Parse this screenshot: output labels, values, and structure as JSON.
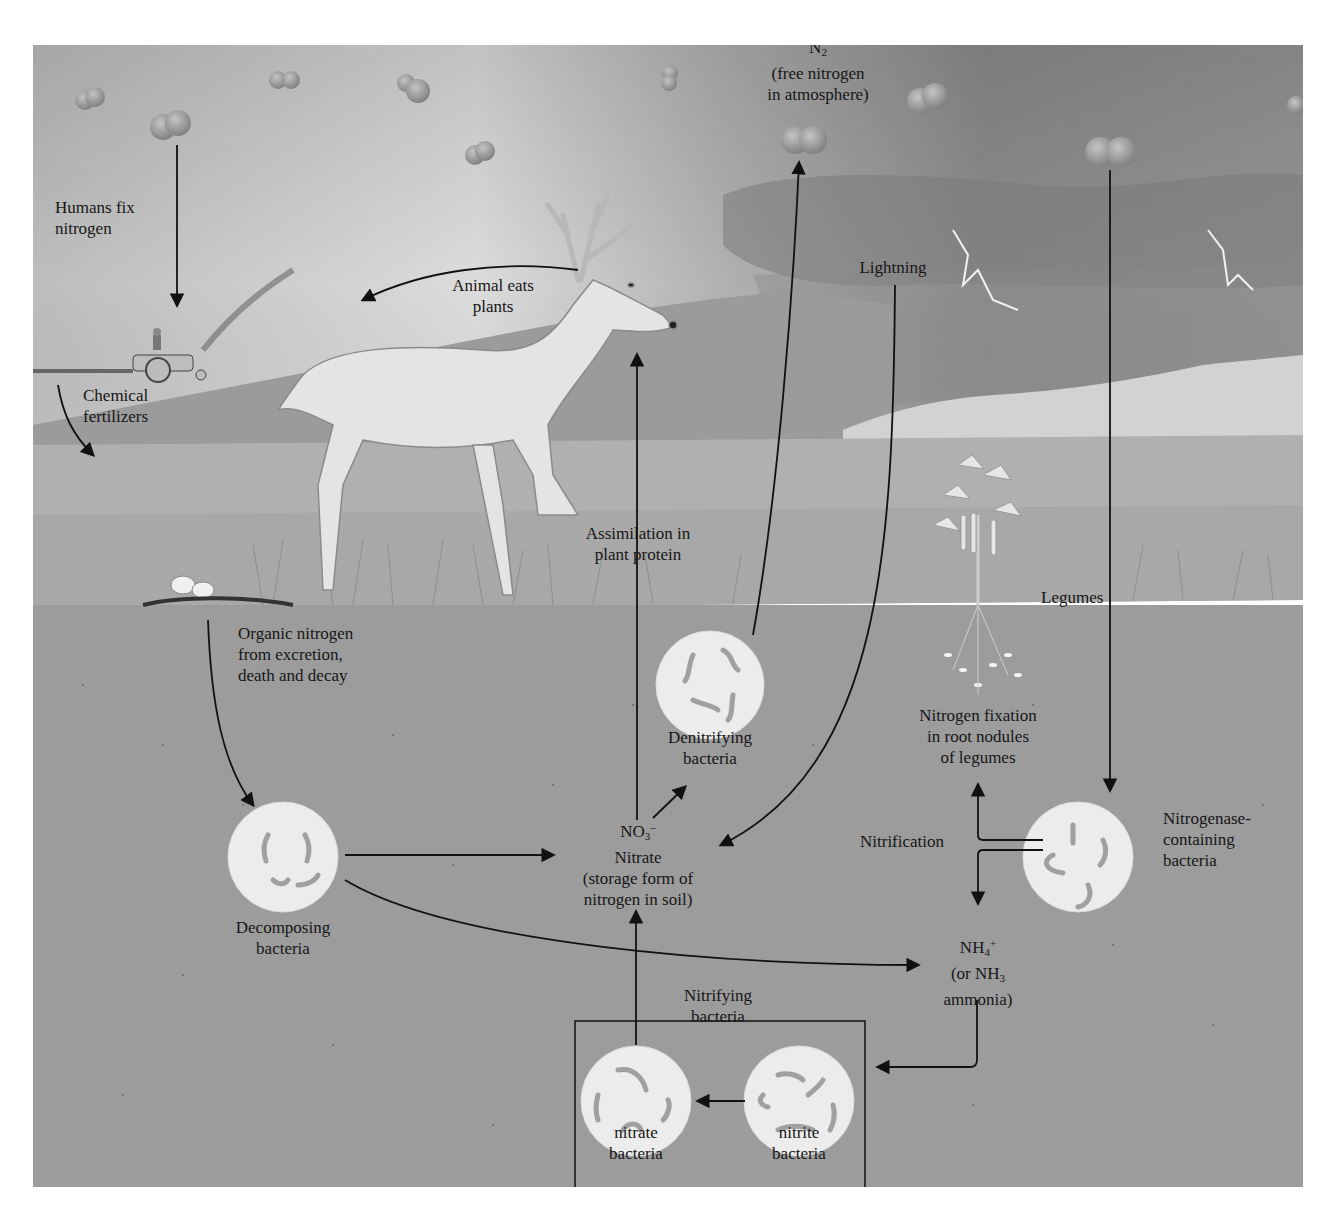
{
  "diagram": {
    "colors": {
      "sky_light": "#e6e6e6",
      "sky_dark": "#8e8e8e",
      "ground": "#a4a4a4",
      "soil": "#9a9a9a",
      "bacteria_fill": "#ededed",
      "bacteria_rod": "#9c9c9c",
      "molecule": "#9a9a9a",
      "arrow": "#111111"
    },
    "labels": {
      "n2": {
        "main": "N",
        "subscript": "2",
        "line2": "(free nitrogen",
        "line3": "in atmosphere)"
      },
      "humans_fix": {
        "line1": "Humans fix",
        "line2": "nitrogen"
      },
      "chemical_fertilizers": {
        "line1": "Chemical",
        "line2": "fertilizers"
      },
      "animal_eats": {
        "line1": "Animal eats",
        "line2": "plants"
      },
      "lightning": "Lightning",
      "assimilation": {
        "line1": "Assimilation in",
        "line2": "plant protein"
      },
      "legumes": "Legumes",
      "organic_nitrogen": {
        "line1": "Organic nitrogen",
        "line2": "from excretion,",
        "line3": "death and decay"
      },
      "denitrifying": {
        "line1": "Denitrifying",
        "line2": "bacteria"
      },
      "nitrogen_fixation": {
        "line1": "Nitrogen fixation",
        "line2": "in root nodules",
        "line3": "of legumes"
      },
      "nitrate": {
        "formula_main": "NO",
        "formula_sub": "3",
        "formula_sup": "–",
        "line2": "Nitrate",
        "line3": "(storage form of",
        "line4": "nitrogen in soil)"
      },
      "nitrification": "Nitrification",
      "nitrogenase": {
        "line1": "Nitrogenase-",
        "line2": "containing",
        "line3": "bacteria"
      },
      "decomposing": {
        "line1": "Decomposing",
        "line2": "bacteria"
      },
      "ammonium": {
        "formula_main": "NH",
        "formula_sub": "4",
        "formula_sup": "+",
        "line2_a": "(or NH",
        "line2_sub": "3",
        "line3": "ammonia)"
      },
      "nitrifying_box": {
        "line1": "Nitrifying",
        "line2": "bacteria"
      },
      "nitrate_bacteria": {
        "line1": "nitrate",
        "line2": "bacteria"
      },
      "nitrite_bacteria": {
        "line1": "nitrite",
        "line2": "bacteria"
      }
    },
    "flows": [
      {
        "from": "N2 (atmosphere)",
        "to": "Humans fix nitrogen (tractor)"
      },
      {
        "from": "Tractor",
        "to": "Soil",
        "label": "Chemical fertilizers"
      },
      {
        "from": "Deer",
        "to": "Left",
        "label": "Animal eats plants"
      },
      {
        "from": "Nitrate",
        "to": "Plants",
        "label": "Assimilation in plant protein"
      },
      {
        "from": "Denitrifying bacteria",
        "to": "N2"
      },
      {
        "from": "Lightning",
        "to": "Nitrate"
      },
      {
        "from": "N2",
        "to": "Nitrogenase-containing bacteria"
      },
      {
        "from": "Organic matter",
        "to": "Decomposing bacteria",
        "label": "Organic nitrogen from excretion, death and decay"
      },
      {
        "from": "Decomposing bacteria",
        "to": "Nitrate"
      },
      {
        "from": "Decomposing bacteria",
        "to": "NH4+ ammonia"
      },
      {
        "from": "Nitrate",
        "to": "Denitrifying bacteria"
      },
      {
        "from": "Nitrogenase-containing bacteria",
        "to": "Nitrogen fixation in root nodules",
        "label": "Nitrification"
      },
      {
        "from": "Nitrogenase-containing bacteria",
        "to": "NH4+"
      },
      {
        "from": "NH4+",
        "to": "Nitrite bacteria"
      },
      {
        "from": "Nitrite bacteria",
        "to": "Nitrate bacteria"
      },
      {
        "from": "Nitrate bacteria",
        "to": "Nitrate"
      }
    ]
  }
}
